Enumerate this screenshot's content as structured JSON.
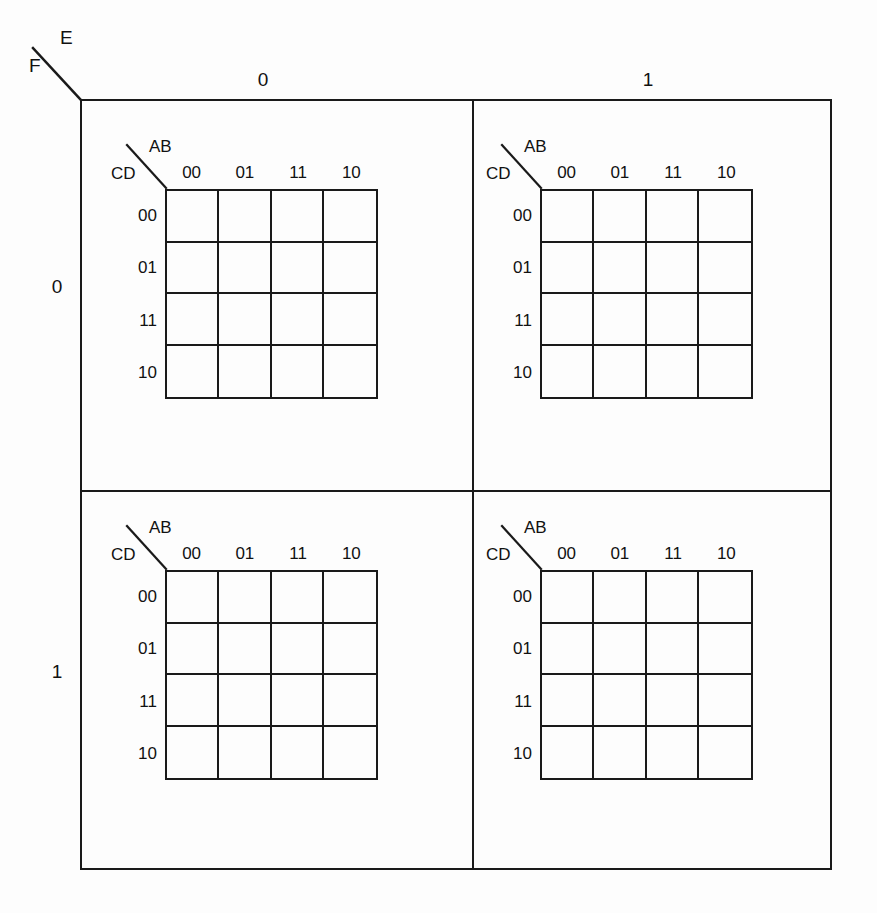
{
  "figure": {
    "kind": "six-variable-karnaugh-map",
    "outer_axis": {
      "column_variable": "E",
      "row_variable": "F",
      "column_labels": [
        "0",
        "1"
      ],
      "row_labels": [
        "0",
        "1"
      ]
    },
    "inner_axis": {
      "column_variable": "AB",
      "row_variable": "CD",
      "column_labels": [
        "00",
        "01",
        "11",
        "10"
      ],
      "row_labels": [
        "00",
        "01",
        "11",
        "10"
      ]
    },
    "colors": {
      "background": "#fdfdfd",
      "line": "#1a1a1a",
      "text": "#111111"
    }
  },
  "quadrants": [
    {
      "name": "quadrant-E0-F0",
      "e": "0",
      "f": "0",
      "corner": {
        "ab": "AB",
        "cd": "CD"
      },
      "columns": [
        "00",
        "01",
        "11",
        "10"
      ],
      "rows": [
        "00",
        "01",
        "11",
        "10"
      ],
      "cells": [
        [
          "",
          "",
          "",
          ""
        ],
        [
          "",
          "",
          "",
          ""
        ],
        [
          "",
          "",
          "",
          ""
        ],
        [
          "",
          "",
          "",
          ""
        ]
      ]
    },
    {
      "name": "quadrant-E1-F0",
      "e": "1",
      "f": "0",
      "corner": {
        "ab": "AB",
        "cd": "CD"
      },
      "columns": [
        "00",
        "01",
        "11",
        "10"
      ],
      "rows": [
        "00",
        "01",
        "11",
        "10"
      ],
      "cells": [
        [
          "",
          "",
          "",
          ""
        ],
        [
          "",
          "",
          "",
          ""
        ],
        [
          "",
          "",
          "",
          ""
        ],
        [
          "",
          "",
          "",
          ""
        ]
      ]
    },
    {
      "name": "quadrant-E0-F1",
      "e": "0",
      "f": "1",
      "corner": {
        "ab": "AB",
        "cd": "CD"
      },
      "columns": [
        "00",
        "01",
        "11",
        "10"
      ],
      "rows": [
        "00",
        "01",
        "11",
        "10"
      ],
      "cells": [
        [
          "",
          "",
          "",
          ""
        ],
        [
          "",
          "",
          "",
          ""
        ],
        [
          "",
          "",
          "",
          ""
        ],
        [
          "",
          "",
          "",
          ""
        ]
      ]
    },
    {
      "name": "quadrant-E1-F1",
      "e": "1",
      "f": "1",
      "corner": {
        "ab": "AB",
        "cd": "CD"
      },
      "columns": [
        "00",
        "01",
        "11",
        "10"
      ],
      "rows": [
        "00",
        "01",
        "11",
        "10"
      ],
      "cells": [
        [
          "",
          "",
          "",
          ""
        ],
        [
          "",
          "",
          "",
          ""
        ],
        [
          "",
          "",
          "",
          ""
        ],
        [
          "",
          "",
          "",
          ""
        ]
      ]
    }
  ]
}
